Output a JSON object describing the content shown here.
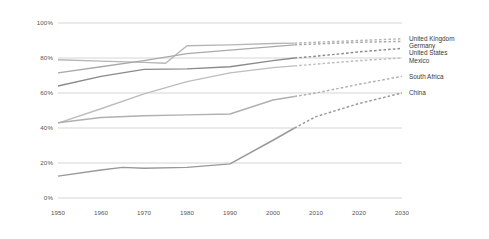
{
  "chart_data": {
    "type": "line",
    "title": "",
    "subtitle": "",
    "xlabel": "",
    "ylabel": "",
    "xlim": [
      1950,
      2030
    ],
    "ylim": [
      0,
      100
    ],
    "grid": true,
    "legend_position": "right",
    "x_ticks": [
      "1950",
      "1960",
      "1970",
      "1980",
      "1990",
      "2000",
      "2010",
      "2020",
      "2030"
    ],
    "x_tick_values": [
      1950,
      1960,
      1970,
      1980,
      1990,
      2000,
      2010,
      2020,
      2030
    ],
    "y_ticks": [
      "0%",
      "20%",
      "40%",
      "60%",
      "80%",
      "100%"
    ],
    "y_tick_values": [
      0,
      20,
      40,
      60,
      80,
      100
    ],
    "projection_start_year": 2005,
    "note": "Solid segments are historical through 2005; dashed segments are projections to 2030.",
    "series": [
      {
        "name": "United Kingdom",
        "color": "#b6b6b6",
        "x": [
          1950,
          1960,
          1970,
          1975,
          1980,
          1990,
          2000,
          2005,
          2010,
          2020,
          2030
        ],
        "values": [
          79,
          78.2,
          77.5,
          77,
          87,
          87.5,
          88.3,
          88.5,
          89,
          90,
          91
        ]
      },
      {
        "name": "Germany",
        "color": "#a9a9a9",
        "x": [
          1950,
          1960,
          1970,
          1980,
          1990,
          2000,
          2005,
          2010,
          2020,
          2030
        ],
        "values": [
          71.5,
          75,
          78.5,
          82.5,
          84.5,
          86.5,
          87.5,
          88,
          89,
          89.5
        ]
      },
      {
        "name": "United States",
        "color": "#8a8a8a",
        "x": [
          1950,
          1960,
          1970,
          1980,
          1990,
          2000,
          2005,
          2010,
          2020,
          2030
        ],
        "values": [
          64,
          69.5,
          73.5,
          73.8,
          75,
          78.5,
          80,
          81,
          83.5,
          85.5
        ]
      },
      {
        "name": "Mexico",
        "color": "#bdbdbd",
        "x": [
          1950,
          1960,
          1970,
          1980,
          1990,
          2000,
          2005,
          2010,
          2020,
          2030
        ],
        "values": [
          42.8,
          51,
          59.5,
          66.5,
          71.5,
          74.5,
          75.5,
          76.5,
          78.5,
          80
        ]
      },
      {
        "name": "South Africa",
        "color": "#b0b0b0",
        "x": [
          1950,
          1960,
          1970,
          1980,
          1990,
          2000,
          2005,
          2010,
          2020,
          2030
        ],
        "values": [
          43,
          46,
          47,
          47.5,
          48,
          56,
          58,
          60,
          65,
          69.5
        ]
      },
      {
        "name": "China",
        "color": "#999999",
        "x": [
          1950,
          1960,
          1965,
          1970,
          1980,
          1990,
          2000,
          2005,
          2010,
          2020,
          2030
        ],
        "values": [
          12.5,
          16,
          17.5,
          17,
          17.5,
          19.5,
          33,
          40,
          46.5,
          54,
          60
        ]
      }
    ],
    "legend_entries": [
      {
        "label": "United Kingdom"
      },
      {
        "label": "Germany"
      },
      {
        "label": "United States"
      },
      {
        "label": "Mexico"
      },
      {
        "label": "South Africa"
      },
      {
        "label": "China"
      }
    ]
  }
}
